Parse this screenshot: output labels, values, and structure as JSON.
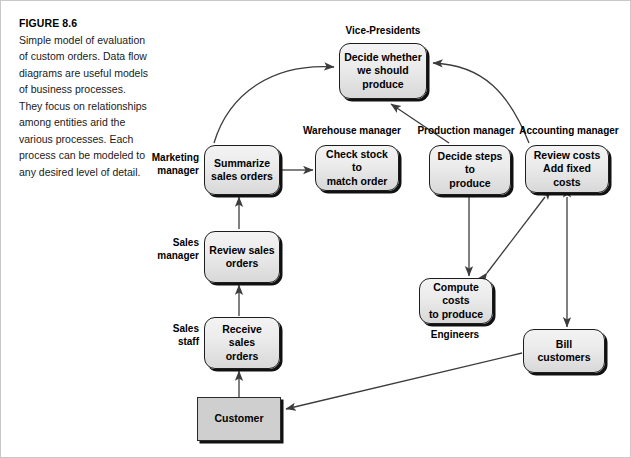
{
  "caption": {
    "figure_number": "FIGURE 8.6",
    "text": "Simple model of evaluation of custom orders. Data flow diagrams are useful models of business processes. They focus on relationships among entities arid the various processes. Each process can be modeled to any desired level of detail."
  },
  "colors": {
    "node_fill_top": "#f3f3f3",
    "node_fill_bottom": "#d8d8d8",
    "node_border": "#1d1d1d",
    "entity_fill": "#cfcfcf",
    "edge": "#3c3c3c",
    "page_background": "#ffffff"
  },
  "diagram": {
    "type": "data-flow-diagram",
    "nodes": [
      {
        "id": "decide_produce",
        "label": "Decide whether\nwe should\nproduce",
        "shape": "rounded-process"
      },
      {
        "id": "summarize",
        "label": "Summarize\nsales orders",
        "shape": "rounded-process"
      },
      {
        "id": "check_stock",
        "label": "Check stock to\nmatch order",
        "shape": "rounded-process"
      },
      {
        "id": "decide_steps",
        "label": "Decide steps to\nproduce",
        "shape": "rounded-process"
      },
      {
        "id": "review_costs",
        "label": "Review costs\nAdd fixed costs",
        "shape": "rounded-process"
      },
      {
        "id": "review_sales",
        "label": "Review sales\norders",
        "shape": "rounded-process"
      },
      {
        "id": "receive_sales",
        "label": "Receive sales\norders",
        "shape": "rounded-process"
      },
      {
        "id": "compute_costs",
        "label": "Compute costs\nto produce",
        "shape": "rounded-process"
      },
      {
        "id": "bill_customers",
        "label": "Bill customers",
        "shape": "rounded-process"
      },
      {
        "id": "customer",
        "label": "Customer",
        "shape": "rectangle-entity"
      }
    ],
    "roles": [
      {
        "id": "vice_presidents",
        "label": "Vice-Presidents",
        "for": "decide_produce"
      },
      {
        "id": "marketing_manager",
        "label": "Marketing\nmanager",
        "for": "summarize"
      },
      {
        "id": "warehouse_manager",
        "label": "Warehouse manager",
        "for": "check_stock"
      },
      {
        "id": "production_manager",
        "label": "Production manager",
        "for": "decide_steps"
      },
      {
        "id": "accounting_manager",
        "label": "Accounting manager",
        "for": "review_costs"
      },
      {
        "id": "sales_manager",
        "label": "Sales\nmanager",
        "for": "review_sales"
      },
      {
        "id": "sales_staff",
        "label": "Sales\nstaff",
        "for": "receive_sales"
      },
      {
        "id": "engineers",
        "label": "Engineers",
        "for": "compute_costs"
      }
    ],
    "edges": [
      {
        "from": "customer",
        "to": "receive_sales",
        "arrows": "one-way"
      },
      {
        "from": "receive_sales",
        "to": "review_sales",
        "arrows": "one-way"
      },
      {
        "from": "review_sales",
        "to": "summarize",
        "arrows": "one-way"
      },
      {
        "from": "summarize",
        "to": "check_stock",
        "arrows": "two-way"
      },
      {
        "from": "summarize",
        "to": "decide_produce",
        "arrows": "one-way",
        "style": "curved"
      },
      {
        "from": "decide_steps",
        "to": "decide_produce",
        "arrows": "one-way",
        "style": "straight"
      },
      {
        "from": "review_costs",
        "to": "decide_produce",
        "arrows": "one-way",
        "style": "curved"
      },
      {
        "from": "decide_steps",
        "to": "compute_costs",
        "arrows": "two-way"
      },
      {
        "from": "compute_costs",
        "to": "review_costs",
        "arrows": "two-way"
      },
      {
        "from": "review_costs",
        "to": "bill_customers",
        "arrows": "two-way"
      },
      {
        "from": "bill_customers",
        "to": "customer",
        "arrows": "one-way"
      }
    ]
  }
}
